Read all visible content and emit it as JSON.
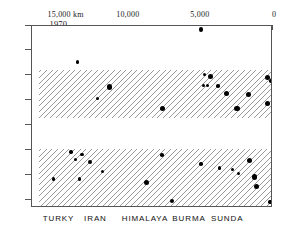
{
  "chart_data": {
    "type": "scatter",
    "title": "",
    "xlabel": "",
    "ylabel": "",
    "xlim": [
      16700,
      0
    ],
    "ylim": [
      1897,
      1970
    ],
    "x_axis_position": "top",
    "x_axis_unit": "km",
    "x_tick_values": [
      15000,
      10000,
      5000,
      0
    ],
    "x_tick_labels": [
      "15,000 km",
      "10,000",
      "5,000",
      "0"
    ],
    "y_tick_values": [
      1970,
      1960,
      1950,
      1940,
      1930,
      1920,
      1910,
      1900
    ],
    "y_tick_labels": [
      "1970",
      "1960",
      "1950",
      "1940",
      "1930",
      "1920",
      "1910",
      "1900"
    ],
    "grid": false,
    "legend": "none",
    "region_labels": [
      {
        "label": "TURKY",
        "x_frac": 0.115
      },
      {
        "label": "IRAN",
        "x_frac": 0.268
      },
      {
        "label": "HIMALAYA",
        "x_frac": 0.472
      },
      {
        "label": "BURMA",
        "x_frac": 0.655
      },
      {
        "label": "SUNDA",
        "x_frac": 0.815
      }
    ],
    "bands": [
      {
        "name": "upper-migration-band",
        "year_top": 1952.5,
        "year_bottom": 1933.0,
        "hatch": "diagonal",
        "inset_left": true
      },
      {
        "name": "lower-migration-band",
        "year_top": 1920.5,
        "year_bottom": 1897.0,
        "hatch": "diagonal",
        "inset_left": true
      }
    ],
    "points": [
      {
        "km": 5000,
        "year": 1968.5,
        "size": 4.5
      },
      {
        "km": 13550,
        "year": 1955.5,
        "size": 3.4
      },
      {
        "km": 4750,
        "year": 1950.5,
        "size": 3.4
      },
      {
        "km": 4300,
        "year": 1949.8,
        "size": 5.0
      },
      {
        "km": 400,
        "year": 1949.5,
        "size": 5.0
      },
      {
        "km": 150,
        "year": 1948.0,
        "size": 3.4
      },
      {
        "km": 4800,
        "year": 1946.0,
        "size": 3.2
      },
      {
        "km": 4550,
        "year": 1946.0,
        "size": 3.2
      },
      {
        "km": 3800,
        "year": 1946.0,
        "size": 3.6
      },
      {
        "km": 11350,
        "year": 1945.6,
        "size": 5.4
      },
      {
        "km": 3250,
        "year": 1942.8,
        "size": 5.0
      },
      {
        "km": 1700,
        "year": 1942.4,
        "size": 5.0
      },
      {
        "km": 12150,
        "year": 1941.0,
        "size": 3.2
      },
      {
        "km": 400,
        "year": 1939.0,
        "size": 5.2
      },
      {
        "km": 7650,
        "year": 1937.0,
        "size": 5.4
      },
      {
        "km": 2500,
        "year": 1936.8,
        "size": 5.2
      },
      {
        "km": 14000,
        "year": 1919.4,
        "size": 3.4
      },
      {
        "km": 13250,
        "year": 1918.4,
        "size": 3.6
      },
      {
        "km": 7700,
        "year": 1918.2,
        "size": 3.6
      },
      {
        "km": 13700,
        "year": 1916.4,
        "size": 3.4
      },
      {
        "km": 1600,
        "year": 1916.0,
        "size": 5.2
      },
      {
        "km": 12700,
        "year": 1915.6,
        "size": 3.8
      },
      {
        "km": 5000,
        "year": 1914.6,
        "size": 3.4
      },
      {
        "km": 3700,
        "year": 1913.0,
        "size": 3.4
      },
      {
        "km": 2800,
        "year": 1912.4,
        "size": 3.0
      },
      {
        "km": 11800,
        "year": 1911.6,
        "size": 3.4
      },
      {
        "km": 2400,
        "year": 1910.8,
        "size": 3.6
      },
      {
        "km": 15200,
        "year": 1908.6,
        "size": 3.4
      },
      {
        "km": 13400,
        "year": 1908.6,
        "size": 3.4
      },
      {
        "km": 1300,
        "year": 1909.4,
        "size": 5.2
      },
      {
        "km": 8750,
        "year": 1907.4,
        "size": 5.0
      },
      {
        "km": 1150,
        "year": 1905.6,
        "size": 5.2
      },
      {
        "km": 7000,
        "year": 1899.8,
        "size": 4.8
      },
      {
        "km": 200,
        "year": 1899.4,
        "size": 3.4
      }
    ]
  }
}
